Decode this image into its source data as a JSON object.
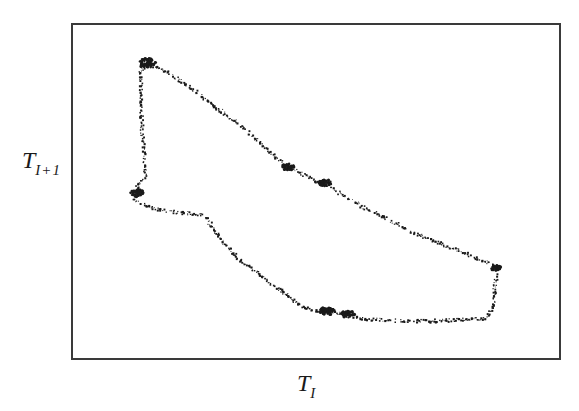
{
  "chart_data": {
    "type": "scatter",
    "title": "",
    "xlabel": "T_I",
    "ylabel": "T_{I+1}",
    "xlabel_main": "T",
    "xlabel_sub": "I",
    "ylabel_main": "T",
    "ylabel_sub": "I+1",
    "grid": false,
    "legend": null,
    "ticks": "none",
    "point_color": "#1a1a1a",
    "frame_color": "#3a3a3a",
    "loop_path_px": [
      [
        147,
        63
      ],
      [
        160,
        68
      ],
      [
        180,
        80
      ],
      [
        200,
        95
      ],
      [
        220,
        110
      ],
      [
        240,
        125
      ],
      [
        262,
        145
      ],
      [
        285,
        165
      ],
      [
        305,
        175
      ],
      [
        322,
        183
      ],
      [
        340,
        193
      ],
      [
        360,
        205
      ],
      [
        390,
        220
      ],
      [
        420,
        235
      ],
      [
        445,
        245
      ],
      [
        470,
        255
      ],
      [
        497,
        266
      ],
      [
        494,
        285
      ],
      [
        493,
        305
      ],
      [
        485,
        318
      ],
      [
        460,
        319
      ],
      [
        440,
        320
      ],
      [
        415,
        320
      ],
      [
        390,
        320
      ],
      [
        365,
        318
      ],
      [
        350,
        315
      ],
      [
        335,
        312
      ],
      [
        325,
        311
      ],
      [
        312,
        309
      ],
      [
        300,
        305
      ],
      [
        280,
        290
      ],
      [
        260,
        275
      ],
      [
        240,
        260
      ],
      [
        225,
        245
      ],
      [
        212,
        228
      ],
      [
        205,
        215
      ],
      [
        192,
        213
      ],
      [
        180,
        212
      ],
      [
        165,
        210
      ],
      [
        150,
        207
      ],
      [
        138,
        202
      ],
      [
        133,
        197
      ],
      [
        135,
        190
      ],
      [
        137,
        185
      ],
      [
        145,
        175
      ],
      [
        144,
        160
      ],
      [
        142,
        140
      ],
      [
        141,
        120
      ],
      [
        140,
        100
      ],
      [
        140,
        85
      ],
      [
        140,
        70
      ],
      [
        147,
        63
      ]
    ],
    "dense_clusters_px": [
      {
        "x": 147,
        "y": 63,
        "r": 7
      },
      {
        "x": 288,
        "y": 167,
        "r": 5
      },
      {
        "x": 325,
        "y": 183,
        "r": 5
      },
      {
        "x": 327,
        "y": 311,
        "r": 6
      },
      {
        "x": 348,
        "y": 314,
        "r": 5
      },
      {
        "x": 137,
        "y": 193,
        "r": 5
      },
      {
        "x": 496,
        "y": 268,
        "r": 4
      }
    ]
  }
}
